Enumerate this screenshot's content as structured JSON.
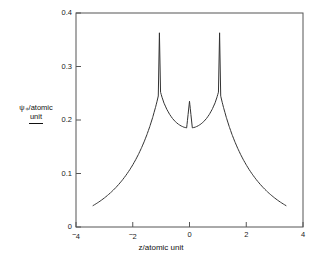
{
  "chart_data": {
    "type": "line",
    "title": "",
    "xlabel": "z/atomic unit",
    "ylabel_numerator": "ψ₊/atomic",
    "ylabel_denominator": "unit",
    "ylabel_plain": "psi+/atomic unit",
    "xlim": [
      -4,
      4
    ],
    "ylim": [
      0,
      0.4
    ],
    "grid": false,
    "legend": "none",
    "xticks": [
      -4,
      -2,
      0,
      2,
      4
    ],
    "xtick_labels": [
      "−4",
      "−2",
      "0",
      "2",
      "4"
    ],
    "yticks": [
      0,
      0.1,
      0.2,
      0.3,
      0.4
    ],
    "ytick_labels": [
      "0",
      "0.1",
      "0.2",
      "0.3",
      "0.4"
    ],
    "line_color": "#333333",
    "line_width": 1,
    "annotations": [
      {
        "label": "left peak",
        "x": -1.06,
        "y": 0.363
      },
      {
        "label": "central minimum",
        "x": 0.0,
        "y": 0.235
      },
      {
        "label": "right peak",
        "x": 1.06,
        "y": 0.363
      }
    ],
    "series": [
      {
        "name": "psi_plus",
        "x": [
          -3.4,
          -3.3,
          -3.2,
          -3.1,
          -3.0,
          -2.9,
          -2.8,
          -2.7,
          -2.6,
          -2.5,
          -2.4,
          -2.3,
          -2.2,
          -2.1,
          -2.0,
          -1.9,
          -1.8,
          -1.7,
          -1.6,
          -1.5,
          -1.4,
          -1.3,
          -1.2,
          -1.15,
          -1.1,
          -1.06,
          -1.02,
          -0.97,
          -0.9,
          -0.8,
          -0.7,
          -0.6,
          -0.5,
          -0.4,
          -0.3,
          -0.2,
          -0.1,
          0.0,
          0.1,
          0.2,
          0.3,
          0.4,
          0.5,
          0.6,
          0.7,
          0.8,
          0.9,
          0.97,
          1.02,
          1.06,
          1.1,
          1.15,
          1.2,
          1.3,
          1.4,
          1.5,
          1.6,
          1.7,
          1.8,
          1.9,
          2.0,
          2.1,
          2.2,
          2.3,
          2.4,
          2.5,
          2.6,
          2.7,
          2.8,
          2.9,
          3.0,
          3.1,
          3.2,
          3.3,
          3.4
        ],
        "y": [
          0.04,
          0.0432,
          0.0466,
          0.0503,
          0.0543,
          0.0586,
          0.0632,
          0.0682,
          0.0735,
          0.0793,
          0.0855,
          0.0923,
          0.0996,
          0.1075,
          0.1161,
          0.1255,
          0.1357,
          0.1469,
          0.1592,
          0.1727,
          0.1877,
          0.2044,
          0.2232,
          0.2336,
          0.2449,
          0.363,
          0.252,
          0.2428,
          0.2318,
          0.22,
          0.2105,
          0.2029,
          0.197,
          0.1924,
          0.189,
          0.1866,
          0.1853,
          0.235,
          0.1853,
          0.1866,
          0.189,
          0.1924,
          0.197,
          0.2029,
          0.2105,
          0.22,
          0.2318,
          0.2428,
          0.252,
          0.363,
          0.2449,
          0.2336,
          0.2232,
          0.2044,
          0.1877,
          0.1727,
          0.1592,
          0.1469,
          0.1357,
          0.1255,
          0.1161,
          0.1075,
          0.0996,
          0.0923,
          0.0855,
          0.0793,
          0.0735,
          0.0682,
          0.0632,
          0.0586,
          0.0543,
          0.0503,
          0.0466,
          0.0432,
          0.04
        ]
      }
    ]
  }
}
